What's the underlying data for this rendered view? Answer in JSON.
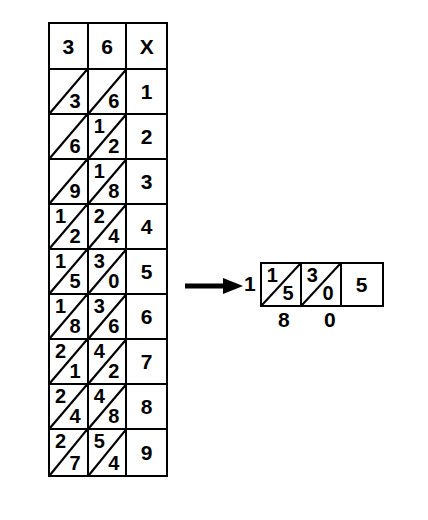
{
  "diagram": {
    "type": "lattice-multiplication-table",
    "main_table": {
      "header": {
        "multiplicand_tens": "3",
        "multiplicand_ones": "6",
        "multiplier_label": "X"
      },
      "rows": [
        {
          "tens_cell": {
            "tens": "",
            "ones": "3"
          },
          "ones_cell": {
            "tens": "",
            "ones": "6"
          },
          "multiplier": "1"
        },
        {
          "tens_cell": {
            "tens": "",
            "ones": "6"
          },
          "ones_cell": {
            "tens": "1",
            "ones": "2"
          },
          "multiplier": "2"
        },
        {
          "tens_cell": {
            "tens": "",
            "ones": "9"
          },
          "ones_cell": {
            "tens": "1",
            "ones": "8"
          },
          "multiplier": "3"
        },
        {
          "tens_cell": {
            "tens": "1",
            "ones": "2"
          },
          "ones_cell": {
            "tens": "2",
            "ones": "4"
          },
          "multiplier": "4"
        },
        {
          "tens_cell": {
            "tens": "1",
            "ones": "5"
          },
          "ones_cell": {
            "tens": "3",
            "ones": "0"
          },
          "multiplier": "5"
        },
        {
          "tens_cell": {
            "tens": "1",
            "ones": "8"
          },
          "ones_cell": {
            "tens": "3",
            "ones": "6"
          },
          "multiplier": "6"
        },
        {
          "tens_cell": {
            "tens": "2",
            "ones": "1"
          },
          "ones_cell": {
            "tens": "4",
            "ones": "2"
          },
          "multiplier": "7"
        },
        {
          "tens_cell": {
            "tens": "2",
            "ones": "4"
          },
          "ones_cell": {
            "tens": "4",
            "ones": "8"
          },
          "multiplier": "8"
        },
        {
          "tens_cell": {
            "tens": "2",
            "ones": "7"
          },
          "ones_cell": {
            "tens": "5",
            "ones": "4"
          },
          "multiplier": "9"
        }
      ]
    },
    "result": {
      "carry_digit": "1",
      "cells": [
        {
          "tens": "1",
          "ones": "5",
          "split": true
        },
        {
          "tens": "3",
          "ones": "0",
          "split": true
        },
        {
          "value": "5",
          "split": false
        }
      ],
      "sum_digits": [
        "8",
        "0"
      ]
    }
  }
}
